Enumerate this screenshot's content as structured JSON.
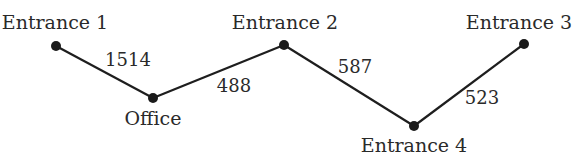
{
  "diagram": {
    "type": "weighted-path-graph",
    "nodes": [
      {
        "id": "e1",
        "label": "Entrance 1",
        "x": 56,
        "y": 46,
        "lx": 55,
        "ly": 29,
        "anchor": "middle"
      },
      {
        "id": "office",
        "label": "Office",
        "x": 153,
        "y": 98,
        "lx": 153,
        "ly": 125,
        "anchor": "middle"
      },
      {
        "id": "e2",
        "label": "Entrance 2",
        "x": 284,
        "y": 45,
        "lx": 285,
        "ly": 29,
        "anchor": "middle"
      },
      {
        "id": "e4",
        "label": "Entrance 4",
        "x": 414,
        "y": 126,
        "lx": 414,
        "ly": 152,
        "anchor": "middle"
      },
      {
        "id": "e3",
        "label": "Entrance 3",
        "x": 524,
        "y": 44,
        "lx": 519,
        "ly": 29,
        "anchor": "middle"
      }
    ],
    "edges": [
      {
        "from": "e1",
        "to": "office",
        "weight": "1514",
        "lx": 128,
        "ly": 66
      },
      {
        "from": "office",
        "to": "e2",
        "weight": "488",
        "lx": 234,
        "ly": 92
      },
      {
        "from": "e2",
        "to": "e4",
        "weight": "587",
        "lx": 355,
        "ly": 73
      },
      {
        "from": "e4",
        "to": "e3",
        "weight": "523",
        "lx": 482,
        "ly": 104
      }
    ]
  }
}
